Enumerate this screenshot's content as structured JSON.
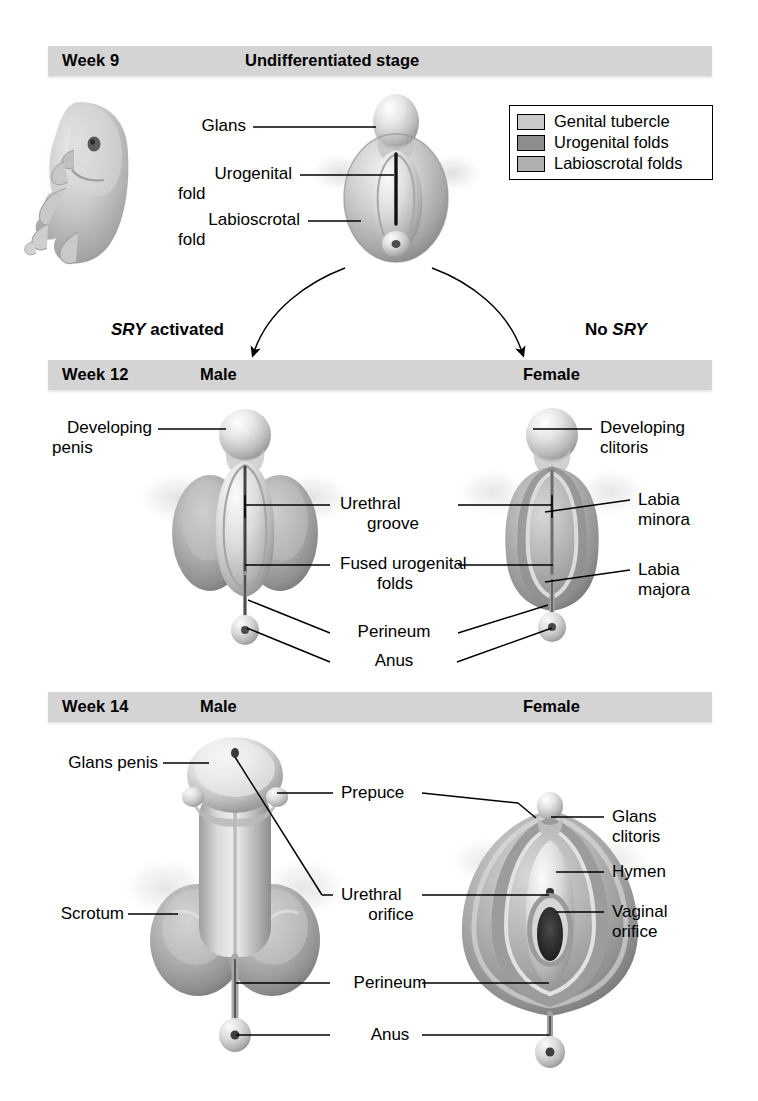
{
  "figure": {
    "type": "anatomical-diagram"
  },
  "stages": [
    {
      "id": "week9",
      "week_label": "Week 9",
      "center_label": "Undifferentiated stage",
      "male_label": "",
      "female_label": "",
      "labels": [
        "Glans",
        "Urogenital\nfold",
        "Labioscrotal\nfold"
      ]
    },
    {
      "id": "week12",
      "week_label": "Week 12",
      "center_label": "",
      "male_label": "Male",
      "female_label": "Female",
      "labels": [
        "Developing\npenis",
        "Urethral\ngroove",
        "Fused urogenital\nfolds",
        "Perineum",
        "Anus",
        "Developing\nclitoris",
        "Labia\nminora",
        "Labia\nmajora"
      ]
    },
    {
      "id": "week14",
      "week_label": "Week 14",
      "center_label": "",
      "male_label": "Male",
      "female_label": "Female",
      "labels": [
        "Glans penis",
        "Scrotum",
        "Prepuce",
        "Urethral\norifice",
        "Perineum",
        "Anus",
        "Glans\nclitoris",
        "Hymen",
        "Vaginal\norifice"
      ]
    }
  ],
  "week9": {
    "week": "Week 9",
    "stage_title": "Undifferentiated stage",
    "label_glans": "Glans",
    "label_urogenital_fold_1": "Urogenital",
    "label_urogenital_fold_2": "fold",
    "label_labioscrotal_fold_1": "Labioscrotal",
    "label_labioscrotal_fold_2": "fold"
  },
  "legend": {
    "items": [
      {
        "label": "Genital tubercle",
        "color": "#c9c9c9"
      },
      {
        "label": "Urogenital folds",
        "color": "#8d8d8d"
      },
      {
        "label": "Labioscrotal folds",
        "color": "#b0b0b0"
      }
    ]
  },
  "pathways": {
    "male_prefix": "SRY",
    "male_suffix": " activated",
    "female_prefix": "No ",
    "female_suffix": "SRY"
  },
  "week12": {
    "week": "Week 12",
    "male": "Male",
    "female": "Female",
    "label_developing_penis_1": "Developing",
    "label_developing_penis_2": "penis",
    "label_urethral_groove_1": "Urethral",
    "label_urethral_groove_2": "groove",
    "label_fused_folds_1": "Fused urogenital",
    "label_fused_folds_2": "folds",
    "label_perineum": "Perineum",
    "label_anus": "Anus",
    "label_developing_clitoris_1": "Developing",
    "label_developing_clitoris_2": "clitoris",
    "label_labia_minora_1": "Labia",
    "label_labia_minora_2": "minora",
    "label_labia_majora_1": "Labia",
    "label_labia_majora_2": "majora"
  },
  "week14": {
    "week": "Week 14",
    "male": "Male",
    "female": "Female",
    "label_glans_penis": "Glans penis",
    "label_scrotum": "Scrotum",
    "label_prepuce": "Prepuce",
    "label_urethral_orifice_1": "Urethral",
    "label_urethral_orifice_2": "orifice",
    "label_perineum": "Perineum",
    "label_anus": "Anus",
    "label_glans_clitoris_1": "Glans",
    "label_glans_clitoris_2": "clitoris",
    "label_hymen": "Hymen",
    "label_vaginal_orifice_1": "Vaginal",
    "label_vaginal_orifice_2": "orifice"
  },
  "colors": {
    "bar_gray": "#d4d4d4",
    "tissue_light": "#e2e2e2",
    "tissue_mid": "#b5b5b5",
    "tissue_dark": "#8a8a8a",
    "leader_line": "#000000",
    "background": "#ffffff"
  }
}
